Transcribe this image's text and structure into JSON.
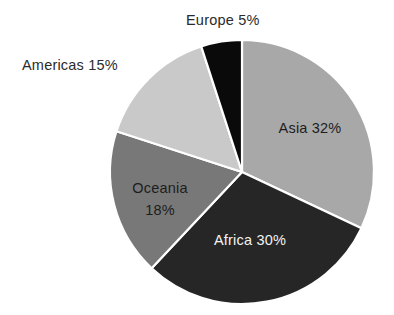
{
  "chart_data": {
    "type": "pie",
    "title": "",
    "subtitle": "",
    "xlabel": "",
    "ylabel": "",
    "legend_position": "none",
    "grid": false,
    "unit": "%",
    "total": 100,
    "categories": [
      "Asia",
      "Africa",
      "Oceania",
      "Americas",
      "Europe"
    ],
    "values": [
      32,
      30,
      18,
      15,
      5
    ],
    "slices": [
      {
        "name": "Asia",
        "value": 32,
        "label": "Asia 32%",
        "color": "#a8a8a8",
        "label_placement": "inside",
        "label_color": "#1d1d1d",
        "start_angle": 0,
        "end_angle": 115.2
      },
      {
        "name": "Africa",
        "value": 30,
        "label": "Africa 30%",
        "color": "#262626",
        "label_placement": "inside",
        "label_color": "#f2f2f2",
        "start_angle": 115.2,
        "end_angle": 223.2
      },
      {
        "name": "Oceania",
        "value": 18,
        "label": "Oceania 18%",
        "label_line1": "Oceania",
        "label_line2": "18%",
        "color": "#787878",
        "label_placement": "inside",
        "label_color": "#1d1d1d",
        "start_angle": 223.2,
        "end_angle": 288
      },
      {
        "name": "Americas",
        "value": 15,
        "label": "Americas 15%",
        "color": "#c9c9c9",
        "label_placement": "outside",
        "label_color": "#2b2b2b",
        "start_angle": 288,
        "end_angle": 342
      },
      {
        "name": "Europe",
        "value": 5,
        "label": "Europe 5%",
        "color": "#0a0a0a",
        "label_placement": "outside",
        "label_color": "#2b2b2b",
        "start_angle": 342,
        "end_angle": 360
      }
    ],
    "geometry": {
      "center_x": 242,
      "center_y": 172,
      "radius": 132,
      "start_at_twelve_oclock": true,
      "direction": "clockwise"
    },
    "colors": {
      "background": "#ffffff",
      "slice_border": "#ffffff",
      "asia": "#a8a8a8",
      "africa": "#262626",
      "oceania": "#787878",
      "americas": "#c9c9c9",
      "europe": "#0a0a0a",
      "text_dark": "#1d1d1d",
      "text_light": "#f2f2f2",
      "text_outer": "#2b2b2b"
    }
  }
}
